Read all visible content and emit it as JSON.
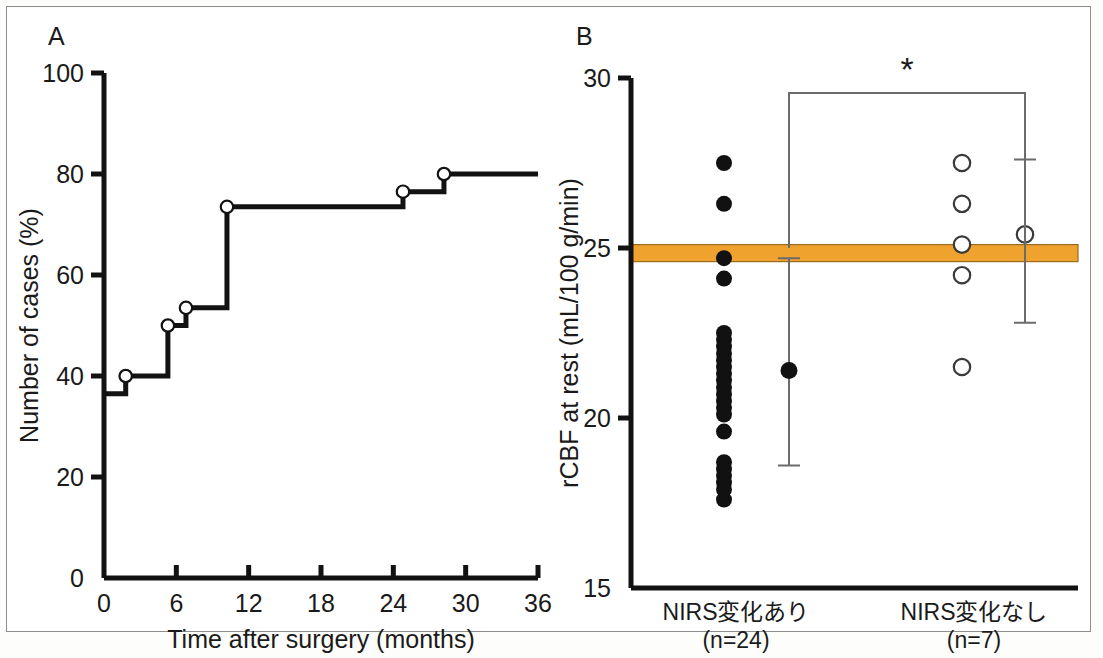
{
  "figure": {
    "background_color": "#ffffff",
    "border_color": "#8d8d8d",
    "axis_color": "#121212",
    "accent_color": "#F0A22E"
  },
  "panelA": {
    "letter": "A",
    "chart_data": {
      "type": "line",
      "subtype": "kaplan-meier-step",
      "title": "",
      "xlabel": "Time after surgery (months)",
      "ylabel": "Number of cases (%)",
      "xlim": [
        0,
        36
      ],
      "ylim": [
        0,
        100
      ],
      "xticks": [
        0,
        6,
        12,
        18,
        24,
        30,
        36
      ],
      "xtick_labels": [
        "0",
        "6",
        "12",
        "18",
        "24",
        "30",
        "36"
      ],
      "yticks": [
        0,
        20,
        40,
        60,
        80,
        100
      ],
      "ytick_labels": [
        "0",
        "20",
        "40",
        "60",
        "80",
        "100"
      ],
      "grid": false,
      "legend": "none",
      "step_points": [
        {
          "x": 0.0,
          "y": 36.5,
          "marker": false
        },
        {
          "x": 1.8,
          "y": 40.0,
          "marker": true
        },
        {
          "x": 5.3,
          "y": 50.0,
          "marker": true
        },
        {
          "x": 6.8,
          "y": 53.5,
          "marker": true
        },
        {
          "x": 10.2,
          "y": 73.5,
          "marker": true
        },
        {
          "x": 24.8,
          "y": 76.5,
          "marker": true
        },
        {
          "x": 28.2,
          "y": 80.0,
          "marker": true
        },
        {
          "x": 36.0,
          "y": 80.0,
          "marker": false
        }
      ]
    }
  },
  "panelB": {
    "letter": "B",
    "significance_marker": "*",
    "chart_data": {
      "type": "scatter",
      "subtype": "dot-plot-with-mean-sd",
      "title": "",
      "xlabel": "",
      "ylabel": "rCBF at rest (mL/100 g/min)",
      "ylim": [
        15,
        30
      ],
      "yticks": [
        15,
        20,
        25,
        30
      ],
      "ytick_labels": [
        "15",
        "20",
        "25",
        "30"
      ],
      "grid": false,
      "legend": "none",
      "reference_band": {
        "label": "normal range",
        "color": "#F0A22E",
        "y_low": 24.6,
        "y_high": 25.1
      },
      "groups": [
        {
          "name": "NIRS変化あり",
          "label_line1": "NIRS変化あり",
          "label_line2": "(n=24)",
          "n": 24,
          "marker": "filled-circle",
          "values": [
            27.5,
            26.3,
            24.7,
            24.1,
            22.5,
            22.3,
            22.1,
            21.9,
            21.7,
            21.5,
            21.3,
            21.1,
            20.9,
            20.7,
            20.5,
            20.3,
            20.1,
            19.6,
            18.7,
            18.5,
            18.3,
            18.1,
            17.9,
            17.6
          ],
          "mean": 21.4,
          "sd_upper": 24.7,
          "sd_lower": 18.6
        },
        {
          "name": "NIRS変化なし",
          "label_line1": "NIRS変化なし",
          "label_line2": "(n=7)",
          "n": 7,
          "marker": "open-circle",
          "values": [
            27.5,
            26.3,
            25.1,
            24.2,
            21.5
          ],
          "mean": 25.4,
          "sd_upper": 27.6,
          "sd_lower": 22.8
        }
      ]
    }
  }
}
